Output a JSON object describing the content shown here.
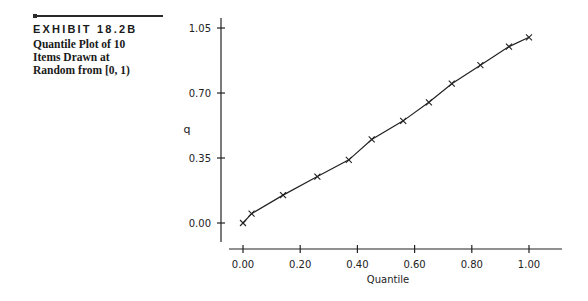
{
  "exhibit": {
    "label": "EXHIBIT 18.2B",
    "caption_lines": [
      "Quantile Plot of 10",
      "Items Drawn at",
      "Random from [0, 1)"
    ]
  },
  "chart_data": {
    "type": "line",
    "title": "Quantile Plot of 10 Items Drawn at Random from [0, 1)",
    "xlabel": "Quantile",
    "ylabel": "q",
    "x_ticks": [
      "0.00",
      "0.20",
      "0.40",
      "0.60",
      "0.80",
      "1.00"
    ],
    "y_ticks": [
      "0.00",
      "0.35",
      "0.70",
      "1.05"
    ],
    "xlim": [
      -0.03,
      1.13
    ],
    "ylim": [
      -0.09,
      1.1
    ],
    "grid": false,
    "legend": null,
    "marker": "x",
    "x": [
      0.0,
      0.03,
      0.14,
      0.26,
      0.37,
      0.45,
      0.56,
      0.65,
      0.73,
      0.83,
      0.93,
      1.0
    ],
    "y": [
      0.0,
      0.05,
      0.15,
      0.25,
      0.34,
      0.45,
      0.55,
      0.65,
      0.75,
      0.85,
      0.95,
      1.0
    ]
  }
}
